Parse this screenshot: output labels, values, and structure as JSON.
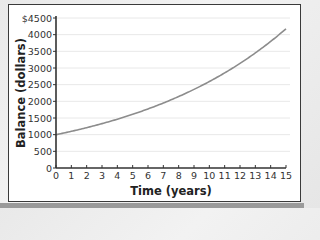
{
  "chart_data": {
    "type": "line",
    "title": "",
    "xlabel": "Time (years)",
    "ylabel": "Balance (dollars)",
    "xlim": [
      0,
      15
    ],
    "ylim": [
      0,
      4500
    ],
    "x_ticks": [
      "0",
      "1",
      "2",
      "3",
      "4",
      "5",
      "6",
      "7",
      "8",
      "9",
      "10",
      "11",
      "12",
      "13",
      "14",
      "15"
    ],
    "y_ticks": [
      "0",
      "500",
      "1000",
      "1500",
      "2000",
      "2500",
      "3000",
      "3500",
      "4000",
      "$4500"
    ],
    "grid": true,
    "legend": null,
    "series": [
      {
        "name": "Balance",
        "color": "#8c8c8c",
        "x": [
          0,
          1,
          2,
          3,
          4,
          5,
          6,
          7,
          8,
          9,
          10,
          11,
          12,
          13,
          14,
          15
        ],
        "values": [
          1000,
          1100,
          1210,
          1331,
          1464,
          1611,
          1772,
          1949,
          2144,
          2358,
          2594,
          2853,
          3138,
          3452,
          3797,
          4177
        ]
      }
    ]
  },
  "colors": {
    "axis": "#333333",
    "grid": "#e8e8e8",
    "curve": "#8c8c8c",
    "frame_border": "#3a3a3a"
  }
}
